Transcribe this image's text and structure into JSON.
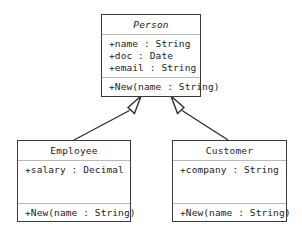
{
  "diagram": {
    "type": "uml-class-diagram",
    "classes": [
      {
        "id": "person",
        "name": "Person",
        "abstract": true,
        "attributes": [
          "+name : String",
          "+doc : Date",
          "+email : String"
        ],
        "operations": [
          "+New(name : String)"
        ]
      },
      {
        "id": "employee",
        "name": "Employee",
        "abstract": false,
        "attributes": [
          "+salary : Decimal"
        ],
        "operations": [
          "+New(name : String)"
        ]
      },
      {
        "id": "customer",
        "name": "Customer",
        "abstract": false,
        "attributes": [
          "+company : String"
        ],
        "operations": [
          "+New(name : String)"
        ]
      }
    ],
    "relationships": [
      {
        "type": "generalization",
        "from": "employee",
        "to": "person"
      },
      {
        "type": "generalization",
        "from": "customer",
        "to": "person"
      }
    ],
    "colors": {
      "border": "#3a3a3a",
      "divider": "#b9b9b9",
      "text": "#1c1c1c",
      "background": "#ffffff",
      "connector": "#2e2e2e"
    }
  }
}
